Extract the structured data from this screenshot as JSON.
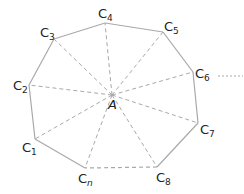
{
  "diagram": {
    "center": {
      "label": "A",
      "x": 112,
      "y": 95,
      "label_x": 108,
      "label_y": 109
    },
    "vertices": [
      {
        "id": "C1",
        "base": "C",
        "sub": "1",
        "x": 35,
        "y": 139,
        "lx": 22,
        "ly": 152
      },
      {
        "id": "C2",
        "base": "C",
        "sub": "2",
        "x": 29,
        "y": 85,
        "lx": 13,
        "ly": 90
      },
      {
        "id": "C3",
        "base": "C",
        "sub": "3",
        "x": 54,
        "y": 39,
        "lx": 40,
        "ly": 37
      },
      {
        "id": "C4",
        "base": "C",
        "sub": "4",
        "x": 105,
        "y": 23,
        "lx": 98,
        "ly": 18
      },
      {
        "id": "C5",
        "base": "C",
        "sub": "5",
        "x": 163,
        "y": 32,
        "lx": 164,
        "ly": 31
      },
      {
        "id": "C6",
        "base": "C",
        "sub": "6",
        "x": 193,
        "y": 72,
        "lx": 195,
        "ly": 78
      },
      {
        "id": "C7",
        "base": "C",
        "sub": "7",
        "x": 198,
        "y": 123,
        "lx": 200,
        "ly": 134
      },
      {
        "id": "C8",
        "base": "C",
        "sub": "8",
        "x": 157,
        "y": 167,
        "lx": 156,
        "ly": 182
      },
      {
        "id": "Cn",
        "base": "C",
        "sub": "n",
        "x": 85,
        "y": 168,
        "lx": 78,
        "ly": 183
      }
    ],
    "solid_edges": [
      [
        "C1",
        "C2"
      ],
      [
        "C2",
        "C3"
      ],
      [
        "C3",
        "C4"
      ],
      [
        "C4",
        "C5"
      ],
      [
        "C5",
        "C6"
      ],
      [
        "C6",
        "C7"
      ],
      [
        "C7",
        "C8"
      ],
      [
        "Cn",
        "C1"
      ]
    ],
    "dashed_edges": [
      [
        "C8",
        "Cn"
      ]
    ],
    "continuation": {
      "x1": 218,
      "y1": 76,
      "x2": 243,
      "y2": 76,
      "meaning": "ellipsis"
    },
    "colors": {
      "edge": "#a9a9a9",
      "spoke": "#a9a9a9",
      "label": "#222222"
    }
  }
}
